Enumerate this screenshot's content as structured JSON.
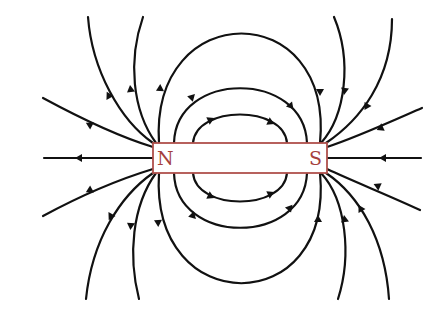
{
  "diagram": {
    "colors": {
      "field_line": "#111111",
      "magnet_outline": "#b0504c",
      "pole_label": "#a5403c",
      "background": "#ffffff"
    },
    "magnet": {
      "x": 153,
      "y": 143,
      "width": 174,
      "height": 30,
      "north_label": "N",
      "south_label": "S"
    },
    "field_lines": {
      "direction": "out of N, into S",
      "closed_loops_above": 3,
      "closed_loops_below": 3,
      "open_lines_left": 7,
      "open_lines_right": 7
    }
  }
}
